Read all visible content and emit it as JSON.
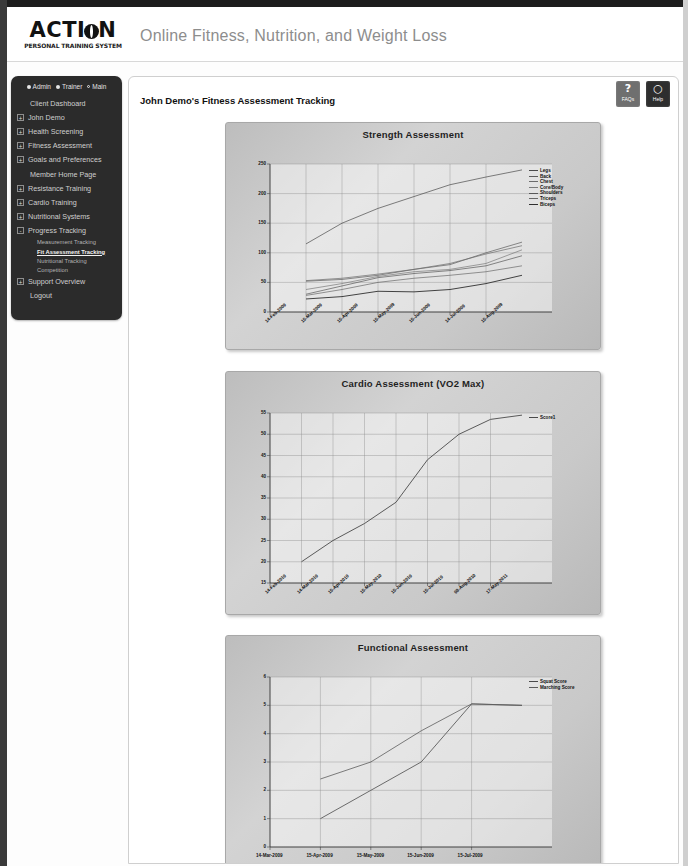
{
  "header": {
    "logo_main": "ACTI",
    "logo_main2": "N",
    "logo_sub": "PERSONAL TRAINING SYSTEM",
    "tagline": "Online Fitness, Nutrition, and Weight Loss"
  },
  "sidebar": {
    "roles": [
      {
        "label": "Admin",
        "marker": "dot"
      },
      {
        "label": "Trainer",
        "marker": "dot"
      },
      {
        "label": "Main",
        "marker": "ring"
      }
    ],
    "items": [
      {
        "label": "Client Dashboard",
        "expandable": false
      },
      {
        "label": "John Demo",
        "expandable": true,
        "toggle": "+"
      },
      {
        "label": "Health Screening",
        "expandable": true,
        "toggle": "+"
      },
      {
        "label": "Fitness Assessment",
        "expandable": true,
        "toggle": "+"
      },
      {
        "label": "Goals and Preferences",
        "expandable": true,
        "toggle": "+"
      },
      {
        "label": "Member Home Page",
        "expandable": false
      },
      {
        "label": "Resistance Training",
        "expandable": true,
        "toggle": "+"
      },
      {
        "label": "Cardio Training",
        "expandable": true,
        "toggle": "+"
      },
      {
        "label": "Nutritional Systems",
        "expandable": true,
        "toggle": "+"
      },
      {
        "label": "Progress Tracking",
        "expandable": true,
        "toggle": "-"
      }
    ],
    "subitems": [
      {
        "label": "Measurement Tracking",
        "active": false
      },
      {
        "label": "Fit Assessment Tracking",
        "active": true
      },
      {
        "label": "Nutritional Tracking",
        "active": false
      },
      {
        "label": "Competition",
        "active": false
      }
    ],
    "items_after": [
      {
        "label": "Support Overview",
        "expandable": true,
        "toggle": "+"
      },
      {
        "label": "Logout",
        "expandable": false
      }
    ]
  },
  "main": {
    "page_title": "John Demo's Fitness Assessment Tracking",
    "help_buttons": [
      {
        "glyph": "?",
        "label": "FAQs",
        "name": "faqs-button"
      },
      {
        "glyph": "○",
        "label": "Help",
        "name": "help-button"
      }
    ]
  },
  "chart_data": [
    {
      "type": "line",
      "title": "Strength Assessment",
      "xlabel": "",
      "ylabel": "",
      "ylim": [
        0,
        250
      ],
      "yticks": [
        0,
        50,
        100,
        150,
        200,
        250
      ],
      "grid": true,
      "legend_position": "right",
      "x": [
        "14-Feb-2009",
        "15-Mar-2009",
        "15-Apr-2009",
        "15-May-2009",
        "15-Jun-2009",
        "14-Jul-2009",
        "15-Aug-2009"
      ],
      "series": [
        {
          "name": "Legs",
          "values": [
            115,
            150,
            175,
            195,
            215,
            228,
            240
          ]
        },
        {
          "name": "Back",
          "values": [
            52,
            55,
            62,
            72,
            80,
            100,
            118
          ]
        },
        {
          "name": "Chest",
          "values": [
            53,
            57,
            64,
            72,
            82,
            98,
            112
          ]
        },
        {
          "name": "Core/Body",
          "values": [
            38,
            48,
            60,
            68,
            72,
            82,
            105
          ]
        },
        {
          "name": "Shoulders",
          "values": [
            30,
            44,
            58,
            65,
            70,
            78,
            95
          ]
        },
        {
          "name": "Triceps",
          "values": [
            28,
            38,
            50,
            57,
            62,
            68,
            78
          ]
        },
        {
          "name": "Biceps",
          "values": [
            22,
            26,
            35,
            34,
            38,
            48,
            62
          ]
        }
      ]
    },
    {
      "type": "line",
      "title": "Cardio Assessment (VO2 Max)",
      "xlabel": "",
      "ylabel": "",
      "ylim": [
        15,
        55
      ],
      "yticks": [
        15,
        20,
        25,
        30,
        35,
        40,
        45,
        50,
        55
      ],
      "grid": true,
      "legend_position": "right",
      "x": [
        "14-Feb-2010",
        "14-Mar-2010",
        "15-Apr-2010",
        "15-May-2010",
        "15-Jun-2010",
        "15-Jul-2010",
        "08-Aug-2010",
        "17-May-2011"
      ],
      "series": [
        {
          "name": "Score1",
          "values": [
            20,
            25,
            29,
            34,
            44,
            50,
            53.5,
            54.5
          ]
        }
      ]
    },
    {
      "type": "line",
      "title": "Functional Assessment",
      "xlabel": "",
      "ylabel": "",
      "ylim": [
        0,
        6
      ],
      "yticks": [
        0,
        1,
        2,
        3,
        4,
        5,
        6
      ],
      "grid": true,
      "legend_position": "right",
      "x": [
        "14-Mar-2009",
        "15-Apr-2009",
        "15-May-2009",
        "15-Jun-2009",
        "15-Jul-2009"
      ],
      "series": [
        {
          "name": "Squat Score",
          "values": [
            2.4,
            3.0,
            4.1,
            5.05,
            5.0
          ]
        },
        {
          "name": "Marching Score",
          "values": [
            1.0,
            2.0,
            3.0,
            5.05,
            5.0
          ]
        }
      ]
    }
  ]
}
